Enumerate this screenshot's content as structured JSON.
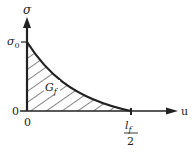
{
  "diagram": {
    "type": "stress-displacement softening curve",
    "axes": {
      "y_label": "σ",
      "x_label": "u",
      "y_tick_label": "σ",
      "y_tick_subscript": "0",
      "origin_y_label": "0",
      "origin_x_label": "0",
      "x_tick_label_num": "l",
      "x_tick_label_num_sub": "f",
      "x_tick_label_den": "2"
    },
    "area_label": "G",
    "area_label_subscript": "f",
    "colors": {
      "line": "#222222",
      "hatch": "#333333",
      "background": "#ffffff"
    }
  }
}
